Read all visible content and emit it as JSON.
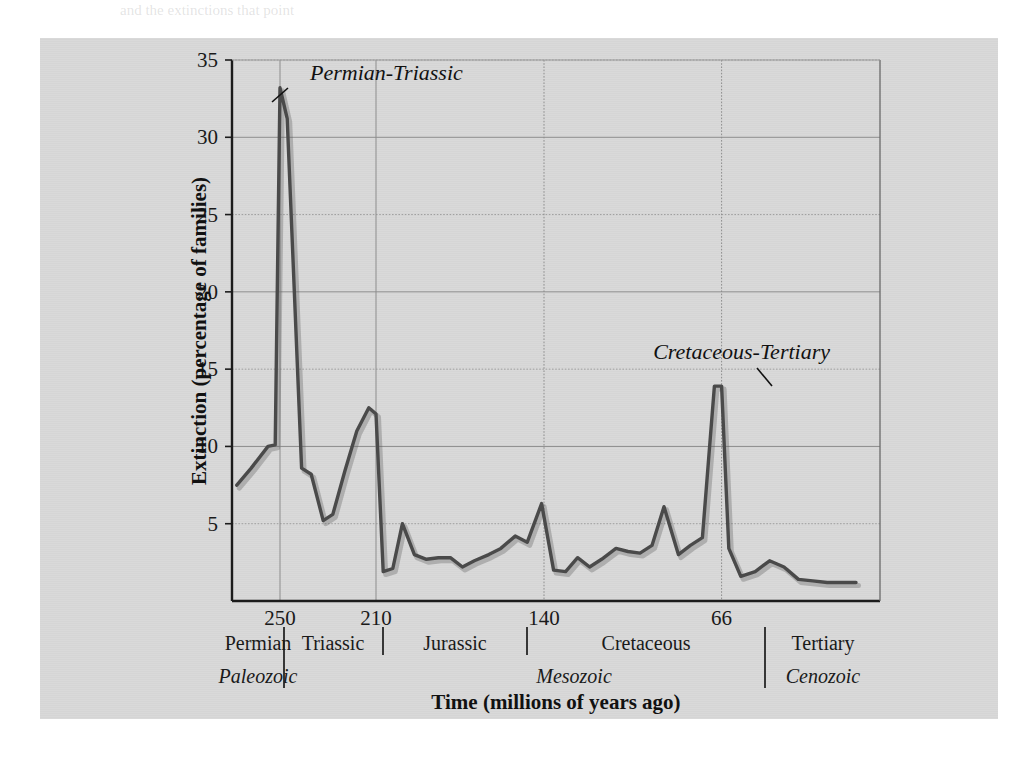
{
  "page": {
    "bleed_through_text": "and the extinctions that point"
  },
  "chart_data": {
    "type": "line",
    "title": "",
    "xlabel": "Time (millions of years ago)",
    "ylabel": "Extinction (percentage of families)",
    "xlim": [
      270,
      0
    ],
    "ylim": [
      0,
      35
    ],
    "grid": true,
    "x_ticks": [
      250,
      210,
      140,
      66
    ],
    "y_ticks": [
      5,
      10,
      15,
      20,
      25,
      30,
      35
    ],
    "legend": "none",
    "series_name": "Extinction rate",
    "line_color": "#4a4a4a",
    "x": [
      268,
      262,
      255,
      252,
      250,
      247,
      241,
      237,
      232,
      228,
      223,
      218,
      213,
      210,
      207,
      203,
      199,
      194,
      189,
      184,
      179,
      174,
      169,
      163,
      158,
      152,
      147,
      141,
      136,
      131,
      126,
      121,
      116,
      110,
      105,
      100,
      95,
      90,
      84,
      79,
      74,
      69,
      66,
      63,
      58,
      52,
      46,
      40,
      34,
      28,
      22,
      16,
      10
    ],
    "y": [
      7.5,
      8.6,
      10.0,
      10.1,
      33.2,
      31.2,
      8.6,
      8.2,
      5.2,
      5.6,
      8.4,
      11.0,
      12.5,
      12.1,
      1.9,
      2.1,
      5.0,
      3.0,
      2.7,
      2.8,
      2.8,
      2.2,
      2.6,
      3.0,
      3.4,
      4.2,
      3.8,
      6.3,
      2.0,
      1.9,
      2.8,
      2.2,
      2.7,
      3.4,
      3.2,
      3.1,
      3.6,
      6.1,
      3.0,
      3.6,
      4.1,
      13.9,
      13.9,
      3.4,
      1.6,
      1.9,
      2.6,
      2.2,
      1.4,
      1.3,
      1.2,
      1.2,
      1.2
    ],
    "annotations": [
      {
        "text": "Permian-Triassic",
        "x": 250,
        "y": 33.2
      },
      {
        "text": "Cretaceous-Tertiary",
        "x": 66,
        "y": 13.9
      }
    ],
    "periods": [
      {
        "label": "Permian"
      },
      {
        "label": "Triassic"
      },
      {
        "label": "Jurassic"
      },
      {
        "label": "Cretaceous"
      },
      {
        "label": "Tertiary"
      }
    ],
    "eras": [
      {
        "label": "Paleozoic"
      },
      {
        "label": "Mesozoic"
      },
      {
        "label": "Cenozoic"
      }
    ]
  }
}
